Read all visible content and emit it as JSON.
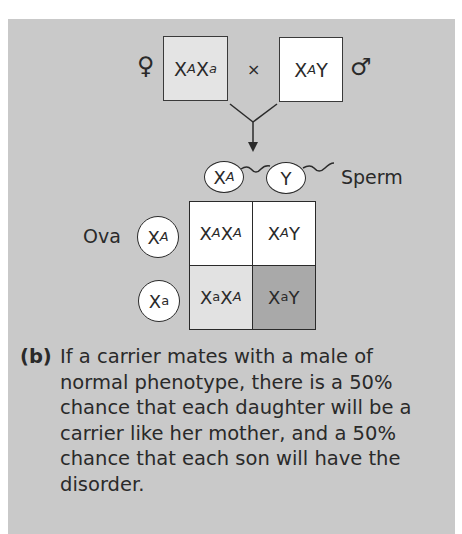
{
  "figure": {
    "panel_label": "(b)",
    "caption": "If a carrier mates with a male of normal phenotype, there is a 50% chance that each daughter will be a carrier like her mother, and a 50% chance that each son will have the disorder."
  },
  "parents": {
    "female": {
      "symbol": "♀",
      "genotype_base1": "X",
      "allele1": "A",
      "genotype_base2": "X",
      "allele2": "a",
      "fill": "#e4e4e4"
    },
    "cross_symbol": "×",
    "male": {
      "symbol": "♂",
      "genotype_base1": "X",
      "allele1": "A",
      "genotype_base2": "Y",
      "fill": "#ffffff"
    }
  },
  "gametes": {
    "sperm_label": "Sperm",
    "sperm": [
      {
        "base": "X",
        "allele": "A"
      },
      {
        "base": "Y",
        "allele": ""
      }
    ],
    "ova_label": "Ova",
    "ova": [
      {
        "base": "X",
        "allele": "A"
      },
      {
        "base": "X",
        "allele": "a"
      }
    ]
  },
  "punnett": {
    "cells": [
      {
        "b1": "X",
        "a1": "A",
        "b2": "X",
        "a2": "A",
        "fill": "#ffffff"
      },
      {
        "b1": "X",
        "a1": "A",
        "b2": "Y",
        "a2": "",
        "fill": "#ffffff"
      },
      {
        "b1": "X",
        "a1": "a",
        "b2": "X",
        "a2": "A",
        "fill": "#e2e2e2"
      },
      {
        "b1": "X",
        "a1": "a",
        "b2": "Y",
        "a2": "",
        "fill": "#a9a9a9"
      }
    ]
  },
  "colors": {
    "panel_bg": "#c9c9c9",
    "stroke": "#2a2a2a"
  }
}
